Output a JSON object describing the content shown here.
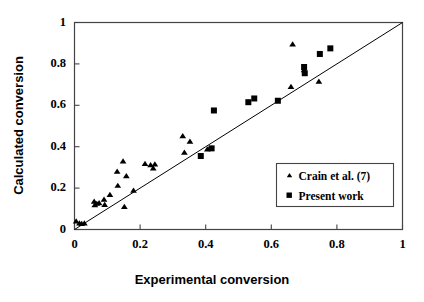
{
  "chart_data": {
    "type": "scatter",
    "title": "",
    "xlabel": "Experimental conversion",
    "ylabel": "Calculated conversion",
    "xlim": [
      0,
      1
    ],
    "ylim": [
      0,
      1
    ],
    "xticks": [
      "0",
      "0.2",
      "0.4",
      "0.6",
      "0.8",
      "1"
    ],
    "xtick_values": [
      0,
      0.2,
      0.4,
      0.6,
      0.8,
      1
    ],
    "yticks": [
      "0",
      "0.2",
      "0.4",
      "0.6",
      "0.8",
      "1"
    ],
    "ytick_values": [
      0,
      0.2,
      0.4,
      0.6,
      0.8,
      1
    ],
    "grid": false,
    "legend_position": "lower-right",
    "reference_line": {
      "name": "parity-line",
      "from": [
        0,
        0
      ],
      "to": [
        1,
        1
      ],
      "style": "solid",
      "color": "#000000"
    },
    "series": [
      {
        "name": "Crain et al. (7)",
        "marker": "triangle",
        "color": "#000000",
        "points": [
          [
            0.005,
            0.04
          ],
          [
            0.015,
            0.03
          ],
          [
            0.022,
            0.028
          ],
          [
            0.03,
            0.03
          ],
          [
            0.06,
            0.135
          ],
          [
            0.062,
            0.118
          ],
          [
            0.068,
            0.125
          ],
          [
            0.075,
            0.128
          ],
          [
            0.09,
            0.145
          ],
          [
            0.092,
            0.12
          ],
          [
            0.108,
            0.168
          ],
          [
            0.13,
            0.28
          ],
          [
            0.132,
            0.212
          ],
          [
            0.148,
            0.33
          ],
          [
            0.152,
            0.11
          ],
          [
            0.158,
            0.258
          ],
          [
            0.18,
            0.188
          ],
          [
            0.215,
            0.318
          ],
          [
            0.232,
            0.312
          ],
          [
            0.24,
            0.296
          ],
          [
            0.245,
            0.315
          ],
          [
            0.33,
            0.452
          ],
          [
            0.335,
            0.372
          ],
          [
            0.352,
            0.425
          ],
          [
            0.405,
            0.388
          ],
          [
            0.412,
            0.392
          ],
          [
            0.665,
            0.895
          ],
          [
            0.66,
            0.69
          ],
          [
            0.7,
            0.77
          ],
          [
            0.745,
            0.715
          ]
        ]
      },
      {
        "name": "Present work",
        "marker": "square",
        "color": "#000000",
        "points": [
          [
            0.385,
            0.355
          ],
          [
            0.418,
            0.392
          ],
          [
            0.425,
            0.575
          ],
          [
            0.53,
            0.615
          ],
          [
            0.548,
            0.633
          ],
          [
            0.62,
            0.622
          ],
          [
            0.7,
            0.785
          ],
          [
            0.702,
            0.755
          ],
          [
            0.748,
            0.848
          ],
          [
            0.78,
            0.875
          ]
        ]
      }
    ]
  },
  "legend": {
    "entries": [
      {
        "label": "Crain et al. (7)",
        "marker": "triangle"
      },
      {
        "label": "Present work",
        "marker": "square"
      }
    ]
  },
  "axes": {
    "x": {
      "label": "Experimental conversion"
    },
    "y": {
      "label": "Calculated conversion"
    }
  },
  "colors": {
    "marker": "#000000",
    "frame": "#3a3a3a",
    "line": "#000000",
    "background": "#ffffff"
  }
}
